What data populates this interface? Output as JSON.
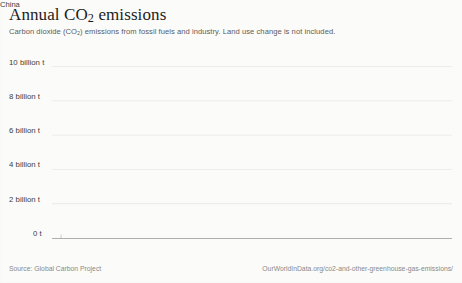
{
  "header": {
    "title_prefix": "Annual CO",
    "title_sub": "2",
    "title_suffix": " emissions",
    "subtitle_a": "Carbon dioxide (CO",
    "subtitle_sub": "2",
    "subtitle_b": ") emissions from fossil fuels and industry. Land use change is not included."
  },
  "footer": {
    "source": "Source: Global Carbon Project",
    "url": "OurWorldInData.org/co2-and-other-greenhouse-gas-emissions/"
  },
  "axes": {
    "y_ticks": [
      "10 billion t",
      "8 billion t",
      "6 billion t",
      "4 billion t",
      "2 billion t",
      "0 t"
    ],
    "x_ticks": [
      "1980",
      "1985",
      "1990",
      "1995",
      "2000",
      "2005",
      "2010",
      "2015",
      "2020"
    ]
  },
  "series_label": "China",
  "colors": {
    "background": "#fbfbfa",
    "line": "#4a4a48",
    "grid": "#e4e4e2",
    "axis": "#9a9a98",
    "title_text": "#1d1d1b",
    "muted_text": "#8a8a88"
  },
  "chart_data": {
    "type": "line",
    "title": "Annual CO2 emissions",
    "subtitle": "Carbon dioxide (CO2) emissions from fossil fuels and industry. Land use change is not included.",
    "xlabel": "",
    "ylabel": "",
    "unit": "tonnes CO2 per year",
    "grid": true,
    "legend": "inline-end-label",
    "xlim": [
      1979,
      2023
    ],
    "ylim": [
      0,
      11.2
    ],
    "y_tick_values": [
      0,
      2,
      4,
      6,
      8,
      10
    ],
    "y_tick_labels": [
      "0 t",
      "2 billion t",
      "4 billion t",
      "6 billion t",
      "8 billion t",
      "10 billion t"
    ],
    "x_tick_values": [
      1980,
      1985,
      1990,
      1995,
      2000,
      2005,
      2010,
      2015,
      2020
    ],
    "series": [
      {
        "name": "China",
        "x": [
          1979,
          1980,
          1981,
          1982,
          1983,
          1984,
          1985,
          1986,
          1987,
          1988,
          1989,
          1990,
          1991,
          1992,
          1993,
          1994,
          1995,
          1996,
          1997,
          1998,
          1999,
          2000,
          2001,
          2002,
          2003,
          2004,
          2005,
          2006,
          2007,
          2008,
          2009,
          2010,
          2011,
          2012,
          2013,
          2014,
          2015,
          2016,
          2017,
          2018,
          2019,
          2020,
          2021,
          2022,
          2023
        ],
        "values": [
          1.48,
          1.49,
          1.47,
          1.57,
          1.67,
          1.81,
          1.95,
          2.08,
          2.24,
          2.39,
          2.48,
          2.49,
          2.62,
          2.76,
          2.95,
          3.1,
          3.33,
          3.42,
          3.41,
          3.35,
          3.33,
          3.42,
          3.5,
          3.72,
          4.31,
          4.96,
          5.54,
          6.13,
          6.62,
          6.93,
          7.51,
          8.08,
          8.86,
          9.06,
          9.24,
          9.19,
          9.1,
          9.07,
          9.32,
          9.61,
          9.83,
          9.94,
          10.44,
          10.54,
          10.92
        ]
      }
    ],
    "annotations": [
      {
        "text": "China",
        "x": 2023,
        "y": 10.92,
        "position": "right"
      }
    ]
  }
}
